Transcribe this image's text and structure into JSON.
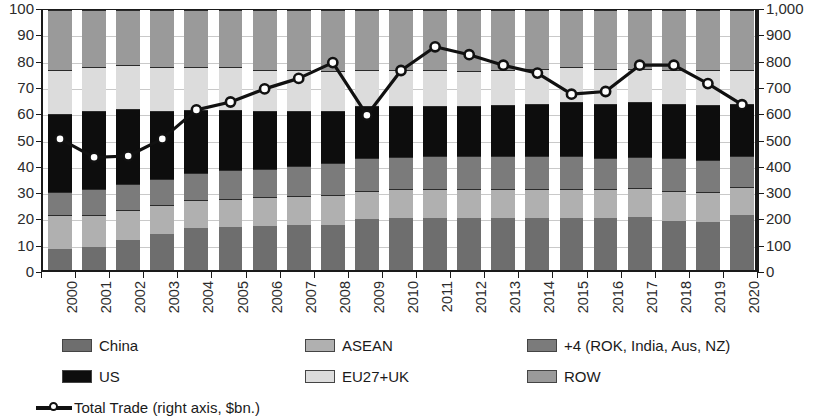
{
  "chart_data": {
    "type": "bar",
    "subtype": "100% stacked bar with overlaid line on secondary axis",
    "title": "",
    "xlabel": "",
    "ylabel": "",
    "ylabel_right": "",
    "grid": true,
    "legend_position": "bottom",
    "categories": [
      "2000",
      "2001",
      "2002",
      "2003",
      "2004",
      "2005",
      "2006",
      "2007",
      "2008",
      "2009",
      "2010",
      "2011",
      "2012",
      "2013",
      "2014",
      "2015",
      "2016",
      "2017",
      "2018",
      "2019",
      "2020"
    ],
    "y_left": {
      "min": 0,
      "max": 100,
      "step": 10,
      "ticks": [
        "0",
        "10",
        "20",
        "30",
        "40",
        "50",
        "60",
        "70",
        "80",
        "90",
        "100"
      ]
    },
    "y_right": {
      "min": 0,
      "max": 1000,
      "step": 100,
      "ticks": [
        "0",
        "100",
        "200",
        "300",
        "400",
        "500",
        "600",
        "700",
        "800",
        "900",
        "1,000"
      ]
    },
    "series": [
      {
        "name": "China",
        "color": "#6e6e6e",
        "axis": "left",
        "values": [
          8,
          9,
          11.5,
          14,
          16,
          16.5,
          17,
          17.5,
          17.5,
          19.5,
          20,
          20,
          20,
          20,
          20,
          20,
          20,
          20.5,
          19,
          18.5,
          21
        ]
      },
      {
        "name": "ASEAN",
        "color": "#b0b0b0",
        "axis": "left",
        "values": [
          13,
          12,
          11.5,
          11,
          11,
          11,
          11,
          11,
          11.5,
          11,
          11,
          11,
          11,
          11,
          11,
          11,
          11,
          11,
          11.5,
          11.5,
          11
        ]
      },
      {
        "name": "+4 (ROK, India, Aus, NZ)",
        "color": "#7b7b7b",
        "axis": "left",
        "values": [
          9,
          10,
          10,
          10,
          10.5,
          11,
          11,
          11.5,
          12,
          12.5,
          12.5,
          13,
          13,
          13,
          13,
          13,
          12,
          12,
          12.5,
          12.5,
          12
        ]
      },
      {
        "name": "US",
        "color": "#0d0d0d",
        "axis": "left",
        "values": [
          30,
          30,
          29,
          26,
          24,
          23,
          22,
          21,
          20,
          20,
          19.5,
          19,
          19,
          19.5,
          20,
          20.5,
          21,
          21,
          21,
          21,
          20
        ]
      },
      {
        "name": "EU27+UK",
        "color": "#dcdcdc",
        "axis": "left",
        "values": [
          17,
          17,
          17,
          17,
          16.5,
          16.5,
          16,
          16,
          15.5,
          14,
          14,
          14,
          13.5,
          13.5,
          13.5,
          13.5,
          13.5,
          13,
          13,
          13.5,
          13
        ]
      },
      {
        "name": "ROW",
        "color": "#9a9a9a",
        "axis": "left",
        "values": [
          23,
          22,
          21,
          22,
          22,
          22,
          23,
          23,
          23.5,
          23,
          23,
          23,
          23.5,
          23,
          22.5,
          22,
          22.5,
          22.5,
          23,
          23,
          23
        ]
      }
    ],
    "line_series": {
      "name": "Total Trade (right axis, $bn.)",
      "axis": "right",
      "color": "#111111",
      "marker": "open-circle",
      "values": [
        510,
        440,
        445,
        510,
        620,
        650,
        700,
        740,
        800,
        600,
        770,
        860,
        830,
        790,
        760,
        680,
        690,
        790,
        790,
        720,
        640
      ]
    }
  },
  "legend": {
    "items": [
      {
        "label": "China",
        "icon": "swatch-china"
      },
      {
        "label": "ASEAN",
        "icon": "swatch-asean"
      },
      {
        "label": "+4 (ROK, India, Aus, NZ)",
        "icon": "swatch-plus4"
      },
      {
        "label": "US",
        "icon": "swatch-us"
      },
      {
        "label": "EU27+UK",
        "icon": "swatch-eu"
      },
      {
        "label": "ROW",
        "icon": "swatch-row"
      },
      {
        "label": "Total Trade (right axis, $bn.)",
        "icon": "line-marker-icon"
      }
    ]
  }
}
